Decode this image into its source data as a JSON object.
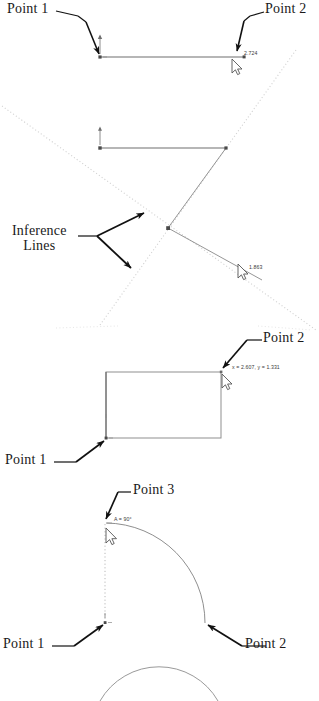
{
  "document": {
    "title": "Line and Arc Inference Point Callouts",
    "ink_color": "#1a1a1a",
    "geometry_color": "#6b6b6b",
    "inference_color": "#cfcfcf",
    "tooltip_color": "#3a3a3a",
    "background": "#ffffff"
  },
  "figures": [
    {
      "id": "figure-horizontal-line",
      "callouts": [
        {
          "name": "point-1-label",
          "text": "Point 1"
        },
        {
          "name": "point-2-label",
          "text": "Point 2"
        }
      ],
      "tooltips": [
        {
          "name": "length-tooltip",
          "text": "2.724"
        }
      ]
    },
    {
      "id": "figure-inference-lines",
      "callouts": [
        {
          "name": "inference-lines-label-line1",
          "text": "Inference"
        },
        {
          "name": "inference-lines-label-line2",
          "text": "Lines"
        }
      ],
      "tooltips": [
        {
          "name": "length-tooltip",
          "text": "1.863"
        }
      ]
    },
    {
      "id": "figure-rectangle",
      "callouts": [
        {
          "name": "point-1-label",
          "text": "Point 1"
        },
        {
          "name": "point-2-label",
          "text": "Point 2"
        }
      ],
      "tooltips": [
        {
          "name": "coordinate-tooltip",
          "text": "x = 2.607, y = 1.331"
        }
      ]
    },
    {
      "id": "figure-arc",
      "callouts": [
        {
          "name": "point-1-label",
          "text": "Point 1"
        },
        {
          "name": "point-2-label",
          "text": "Point 2"
        },
        {
          "name": "point-3-label",
          "text": "Point 3"
        }
      ],
      "tooltips": [
        {
          "name": "angle-tooltip",
          "text": "A = 90°"
        }
      ]
    }
  ]
}
